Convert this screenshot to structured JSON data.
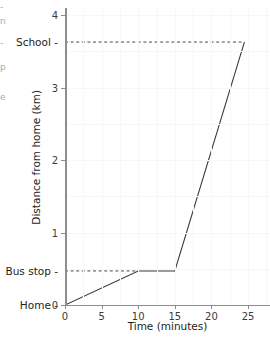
{
  "edge_fragments": [
    {
      "text": "-",
      "top": 2
    },
    {
      "text": "n",
      "top": 16
    },
    {
      "text": "-",
      "top": 38
    },
    {
      "text": "p",
      "top": 62
    },
    {
      "text": "e",
      "top": 92
    }
  ],
  "chart_data": {
    "type": "line",
    "title": "",
    "xlabel": "Time (minutes)",
    "ylabel": "Distance from home (km)",
    "xlim": [
      0,
      28
    ],
    "ylim": [
      0,
      4.1
    ],
    "xticks": [
      0,
      5,
      10,
      15,
      20,
      25
    ],
    "xtick_labels": [
      "0",
      "5",
      "10",
      "15",
      "20",
      "25"
    ],
    "yticks": [
      0,
      1,
      2,
      3,
      4
    ],
    "ytick_labels": [
      "0",
      "1",
      "2",
      "3",
      "4"
    ],
    "grid": true,
    "legend": "none",
    "series": [
      {
        "name": "Journey from home to school",
        "x": [
          0,
          10,
          15,
          24.5
        ],
        "y": [
          0,
          0.47,
          0.47,
          3.63
        ]
      }
    ],
    "markers": [
      {
        "label": "School",
        "value": 3.63,
        "guide": "dashed-horizontal"
      },
      {
        "label": "Bus stop",
        "value": 0.47,
        "guide": "dashed-horizontal"
      },
      {
        "label": "Home",
        "value": 0,
        "guide": "none"
      }
    ],
    "annotations": []
  },
  "colors": {
    "series_stroke": "#3a3a3a",
    "guide_stroke": "#4a4a4a",
    "axis": "#8d8d8d",
    "grid": "#f7f7f7",
    "text": "#1d1d1d",
    "background": "#ffffff"
  }
}
